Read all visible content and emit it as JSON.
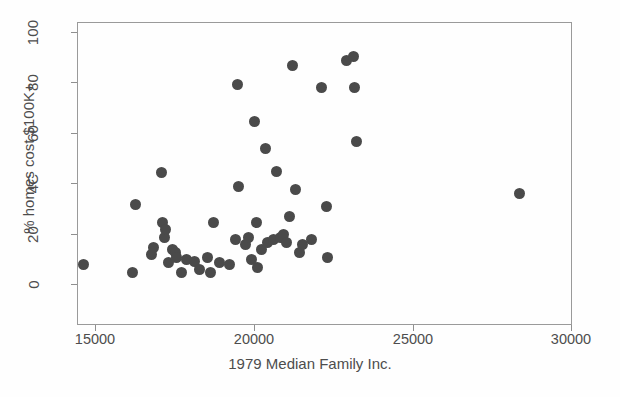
{
  "chart_data": {
    "type": "scatter",
    "title": "",
    "xlabel": "1979 Median Family Inc.",
    "ylabel": "% homes cost $100K+",
    "xlim": [
      14000,
      30000
    ],
    "ylim": [
      0,
      100
    ],
    "xticks": [
      15000,
      20000,
      25000,
      30000
    ],
    "xtick_labels": [
      "15000",
      "20000",
      "25000",
      "30000"
    ],
    "yticks": [
      0,
      20,
      40,
      60,
      80,
      100
    ],
    "ytick_labels": [
      "0",
      "20",
      "4C",
      "60",
      "80",
      "100"
    ],
    "grid": false,
    "legend": null,
    "marker": {
      "shape": "circle",
      "color": "#4a4a4a",
      "size_px": 11
    },
    "points": [
      {
        "x": 14600,
        "y": 8
      },
      {
        "x": 16150,
        "y": 5
      },
      {
        "x": 16250,
        "y": 32
      },
      {
        "x": 16750,
        "y": 12
      },
      {
        "x": 16800,
        "y": 15
      },
      {
        "x": 17050,
        "y": 44.5
      },
      {
        "x": 17100,
        "y": 25
      },
      {
        "x": 17150,
        "y": 19
      },
      {
        "x": 17200,
        "y": 22
      },
      {
        "x": 17300,
        "y": 9
      },
      {
        "x": 17400,
        "y": 14
      },
      {
        "x": 17500,
        "y": 13
      },
      {
        "x": 17550,
        "y": 11
      },
      {
        "x": 17700,
        "y": 5
      },
      {
        "x": 17850,
        "y": 10
      },
      {
        "x": 18100,
        "y": 9.5
      },
      {
        "x": 18250,
        "y": 6
      },
      {
        "x": 18500,
        "y": 11
      },
      {
        "x": 18600,
        "y": 5
      },
      {
        "x": 18700,
        "y": 25
      },
      {
        "x": 18900,
        "y": 9
      },
      {
        "x": 19200,
        "y": 8
      },
      {
        "x": 19400,
        "y": 18
      },
      {
        "x": 19450,
        "y": 79.5
      },
      {
        "x": 19500,
        "y": 39
      },
      {
        "x": 19700,
        "y": 16
      },
      {
        "x": 19800,
        "y": 19
      },
      {
        "x": 19900,
        "y": 10
      },
      {
        "x": 20000,
        "y": 65
      },
      {
        "x": 20050,
        "y": 25
      },
      {
        "x": 20100,
        "y": 7
      },
      {
        "x": 20200,
        "y": 14
      },
      {
        "x": 20350,
        "y": 54
      },
      {
        "x": 20400,
        "y": 17
      },
      {
        "x": 20600,
        "y": 18
      },
      {
        "x": 20700,
        "y": 45
      },
      {
        "x": 20800,
        "y": 19
      },
      {
        "x": 20900,
        "y": 20
      },
      {
        "x": 21000,
        "y": 17
      },
      {
        "x": 21100,
        "y": 27
      },
      {
        "x": 21200,
        "y": 87
      },
      {
        "x": 21300,
        "y": 38
      },
      {
        "x": 21400,
        "y": 13
      },
      {
        "x": 21500,
        "y": 16
      },
      {
        "x": 21800,
        "y": 18
      },
      {
        "x": 22100,
        "y": 78.5
      },
      {
        "x": 22250,
        "y": 31
      },
      {
        "x": 22300,
        "y": 11
      },
      {
        "x": 22900,
        "y": 89
      },
      {
        "x": 23100,
        "y": 90.5
      },
      {
        "x": 23150,
        "y": 78.5
      },
      {
        "x": 23200,
        "y": 57
      },
      {
        "x": 28350,
        "y": 36.5
      }
    ]
  },
  "axes": {
    "x_title": "1979 Median Family Inc.",
    "y_title": "% homes cost $100K+"
  }
}
